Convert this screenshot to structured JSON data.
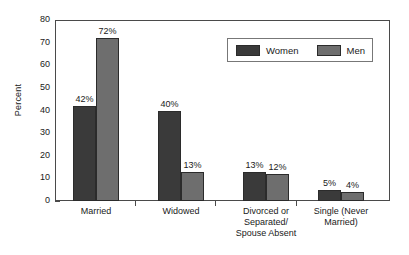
{
  "chart_data": {
    "type": "bar",
    "title": "",
    "xlabel": "",
    "ylabel": "Percent",
    "ylim": [
      0,
      80
    ],
    "ytick_step": 10,
    "yticks": [
      "80",
      "70",
      "60",
      "50",
      "40",
      "30",
      "20",
      "10",
      "0"
    ],
    "grid": false,
    "legend_position": "top-right",
    "categories": [
      "Married",
      "Widowed",
      "Divorced or\nSeparated/\nSpouse Absent",
      "Single (Never\nMarried)"
    ],
    "category_lines": [
      [
        "Married"
      ],
      [
        "Widowed"
      ],
      [
        "Divorced or",
        "Separated/",
        "Spouse Absent"
      ],
      [
        "Single (Never",
        "Married)"
      ]
    ],
    "series": [
      {
        "name": "Women",
        "color": "#3a3a3a",
        "values": [
          42,
          40,
          13,
          5
        ],
        "labels": [
          "42%",
          "40%",
          "13%",
          "5%"
        ]
      },
      {
        "name": "Men",
        "color": "#6e6e6e",
        "values": [
          72,
          13,
          12,
          4
        ],
        "labels": [
          "72%",
          "13%",
          "12%",
          "4%"
        ]
      }
    ]
  },
  "legend": {
    "items": [
      {
        "label": "Women",
        "swatch": "women-swatch"
      },
      {
        "label": "Men",
        "swatch": "men-swatch"
      }
    ]
  },
  "axis": {
    "y_title": "Percent"
  }
}
